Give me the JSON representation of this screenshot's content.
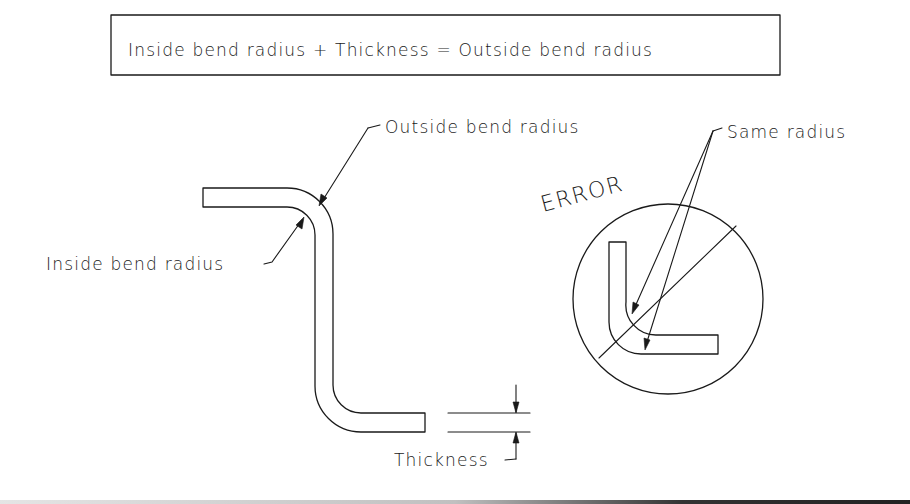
{
  "formula_box": {
    "text": "Inside bend radius + Thickness = Outside bend radius"
  },
  "main_part": {
    "labels": {
      "outside_bend_radius": "Outside bend radius",
      "inside_bend_radius": "Inside bend radius",
      "thickness": "Thickness"
    }
  },
  "error_example": {
    "title": "ERROR",
    "label": "Same radius"
  },
  "colors": {
    "line": "#1a1a1a",
    "background": "#ffffff"
  }
}
